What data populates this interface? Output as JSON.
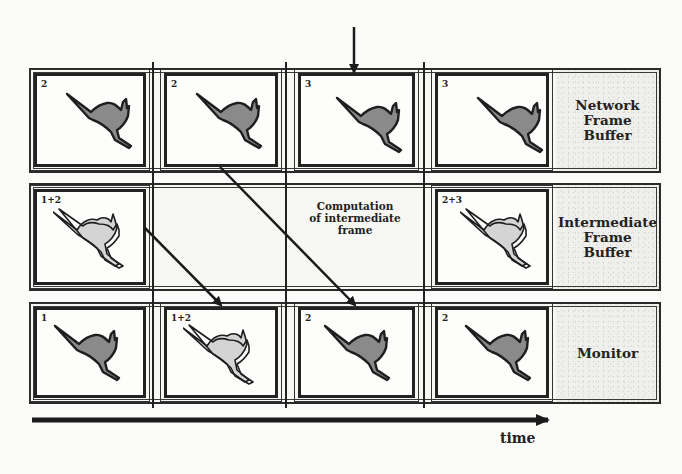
{
  "diagram": {
    "rows": [
      {
        "label": "Network\nFrame\nBuffer",
        "frames": [
          {
            "number": "2",
            "content": "single-kangaroo"
          },
          {
            "number": "2",
            "content": "single-kangaroo"
          },
          {
            "number": "3",
            "content": "single-kangaroo"
          },
          {
            "number": "3",
            "content": "single-kangaroo"
          }
        ]
      },
      {
        "label": "Intermediate\nFrame\nBuffer",
        "frames": [
          {
            "number": "1+2",
            "content": "blended-kangaroo"
          },
          null,
          null,
          {
            "number": "2+3",
            "content": "blended-kangaroo"
          }
        ],
        "center_annotation": "Computation\nof intermediate\nframe"
      },
      {
        "label": "Monitor",
        "frames": [
          {
            "number": "1",
            "content": "single-kangaroo"
          },
          {
            "number": "1+2",
            "content": "blended-kangaroo"
          },
          {
            "number": "2",
            "content": "single-kangaroo"
          },
          {
            "number": "2",
            "content": "single-kangaroo"
          }
        ]
      }
    ],
    "incoming_arrow": "new frame arrival arrow (above column 3)",
    "flow_arrows": [
      {
        "from": "Intermediate Frame Buffer col 1 (1+2)",
        "to": "Monitor col 2 (1+2)"
      },
      {
        "from": "Network Frame Buffer col 2 (2)",
        "to": "Monitor col 3 (2)"
      }
    ],
    "time_axis_label": "time"
  }
}
